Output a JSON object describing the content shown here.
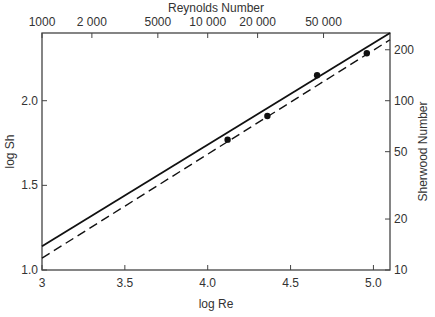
{
  "chart_data": {
    "type": "line",
    "title": "",
    "xlabel": "log Re",
    "ylabel": "log Sh",
    "top_axis_label": "Reynolds Number",
    "right_axis_label": "Sherwood Number",
    "xlim": [
      3.0,
      5.1
    ],
    "ylim": [
      1.0,
      2.4
    ],
    "x_ticks": [
      {
        "v": 3.0,
        "label": "3"
      },
      {
        "v": 3.5,
        "label": "3.5"
      },
      {
        "v": 4.0,
        "label": "4.0"
      },
      {
        "v": 4.5,
        "label": "4.5"
      },
      {
        "v": 5.0,
        "label": "5.0"
      }
    ],
    "y_ticks": [
      {
        "v": 1.0,
        "label": "1.0"
      },
      {
        "v": 1.5,
        "label": "1.5"
      },
      {
        "v": 2.0,
        "label": "2.0"
      }
    ],
    "top_ticks": [
      {
        "v": 1000,
        "label": "1000"
      },
      {
        "v": 2000,
        "label": "2 000"
      },
      {
        "v": 5000,
        "label": "5000"
      },
      {
        "v": 10000,
        "label": "10 000"
      },
      {
        "v": 20000,
        "label": "20 000"
      },
      {
        "v": 50000,
        "label": "50 000"
      }
    ],
    "right_ticks": [
      {
        "v": 10,
        "label": "10"
      },
      {
        "v": 20,
        "label": "20"
      },
      {
        "v": 50,
        "label": "50"
      },
      {
        "v": 100,
        "label": "100"
      },
      {
        "v": 200,
        "label": "200"
      }
    ],
    "series": [
      {
        "name": "solid line",
        "style": "solid",
        "x": [
          3.0,
          5.1
        ],
        "y": [
          1.14,
          2.4
        ]
      },
      {
        "name": "dashed line",
        "style": "dashed",
        "x": [
          3.0,
          5.1
        ],
        "y": [
          1.07,
          2.36
        ]
      },
      {
        "name": "data points",
        "style": "scatter",
        "x": [
          4.12,
          4.36,
          4.66,
          4.96
        ],
        "y": [
          1.77,
          1.91,
          2.15,
          2.28
        ]
      }
    ],
    "grid": false,
    "legend": "none"
  }
}
